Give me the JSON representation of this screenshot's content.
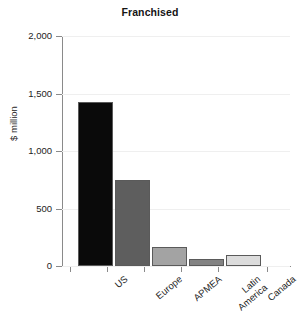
{
  "chart_data": {
    "type": "bar",
    "title": "Franchised",
    "xlabel": "",
    "ylabel": "$ million",
    "categories": [
      "US",
      "Europe",
      "APMEA",
      "Latin America",
      "Canada"
    ],
    "values": [
      1430,
      745,
      165,
      60,
      97
    ],
    "ylim": [
      0,
      2000
    ],
    "yticks": [
      0,
      500,
      1000,
      1500,
      2000
    ],
    "ytick_labels": [
      "0",
      "500",
      "1,000",
      "1,500",
      "2,000"
    ],
    "grid": true,
    "legend": "none",
    "bar_colors": [
      "#0a0a0a",
      "#5e5e5e",
      "#a3a3a3",
      "#838383",
      "#dcdcdc"
    ],
    "bar_edge_color": "#5a5a5a",
    "axis_color": "#8a8a8a",
    "gridline_color": "#efefef",
    "text_color": "#232323",
    "background": "#ffffff"
  }
}
